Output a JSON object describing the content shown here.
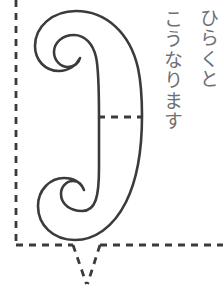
{
  "page": {
    "background_color": "#ffffff",
    "width": 223,
    "height": 297
  },
  "caption": {
    "orientation": "vertical-rtl",
    "color": "#6f6f72",
    "columns": [
      {
        "id": "col-1",
        "text": "ひらくと"
      },
      {
        "id": "col-2",
        "text": "こうなります"
      }
    ],
    "full_text": "ひらくと こうなります"
  },
  "diagram": {
    "stroke_color": "#3b3b3f",
    "dash_color": "#3b3b3f",
    "fill_color": "#ffffff",
    "shape_name": "curved-paper-flap-outline",
    "stroke_width": 2.6,
    "dash_width": 2.8,
    "dash_pattern": "7 6",
    "elements": [
      {
        "name": "left-vertical-dashed-line",
        "type": "dashed-line"
      },
      {
        "name": "bottom-horizontal-dashed-line",
        "type": "dashed-line"
      },
      {
        "name": "v-notch-dashed-line",
        "type": "dashed-polyline"
      },
      {
        "name": "middle-dashed-crease",
        "type": "dashed-line"
      },
      {
        "name": "curved-flap-outline",
        "type": "path"
      }
    ]
  }
}
